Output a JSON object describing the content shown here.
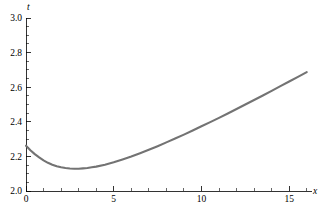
{
  "chart_data": {
    "type": "line",
    "title": "",
    "subtitle": "",
    "xlabel": "x",
    "ylabel": "t",
    "xlim": [
      0,
      16.3
    ],
    "ylim": [
      2.0,
      3.0
    ],
    "grid": false,
    "legend": null,
    "x_ticks": [
      0,
      5,
      10,
      15
    ],
    "x_tick_labels": [
      "0",
      "5",
      "10",
      "15"
    ],
    "x_minor_step": 1,
    "y_ticks": [
      2.0,
      2.2,
      2.4,
      2.6,
      2.8,
      3.0
    ],
    "y_tick_labels": [
      "2.0",
      "2.2",
      "2.4",
      "2.6",
      "2.8",
      "3.0"
    ],
    "y_minor_step": 0.05,
    "series": [
      {
        "name": "t(x)",
        "color": "#737373",
        "x": [
          0,
          0.25,
          0.5,
          0.75,
          1,
          1.25,
          1.5,
          1.75,
          2,
          2.25,
          2.5,
          2.75,
          3,
          3.25,
          3.5,
          3.75,
          4,
          4.5,
          5,
          5.5,
          6,
          6.5,
          7,
          7.5,
          8,
          8.5,
          9,
          9.5,
          10,
          10.5,
          11,
          11.5,
          12,
          12.5,
          13,
          13.5,
          14,
          14.5,
          15,
          15.5,
          16
        ],
        "y": [
          2.262,
          2.236,
          2.213,
          2.194,
          2.177,
          2.163,
          2.152,
          2.143,
          2.137,
          2.133,
          2.13,
          2.129,
          2.129,
          2.131,
          2.133,
          2.137,
          2.141,
          2.152,
          2.166,
          2.182,
          2.199,
          2.218,
          2.238,
          2.259,
          2.281,
          2.303,
          2.326,
          2.35,
          2.374,
          2.398,
          2.423,
          2.448,
          2.474,
          2.5,
          2.526,
          2.552,
          2.579,
          2.606,
          2.633,
          2.66,
          2.687
        ]
      }
    ],
    "annotations": {
      "minimum_x": 3.0,
      "minimum_y": 2.13,
      "start_y": 2.26,
      "end_x": 16.0,
      "end_y": 2.74
    }
  },
  "plot": {
    "background_color": "#ffffff",
    "axis_color": "#000000",
    "curve_color": "#737373"
  }
}
